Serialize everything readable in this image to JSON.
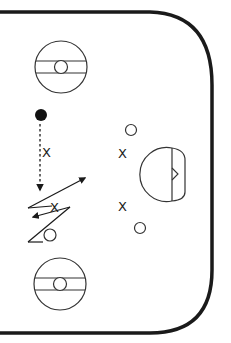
{
  "diagram": {
    "colors": {
      "line": "#1a1a1a",
      "background": "#ffffff"
    },
    "players": [
      {
        "type": "X",
        "label": "X",
        "x": 47,
        "y": 152
      },
      {
        "type": "X",
        "label": "X",
        "x": 55,
        "y": 211
      },
      {
        "type": "X",
        "label": "X",
        "x": 123,
        "y": 157
      },
      {
        "type": "X",
        "label": "X",
        "x": 123,
        "y": 210
      }
    ],
    "markers": [
      {
        "type": "O",
        "x": 50,
        "y": 235
      },
      {
        "type": "O",
        "x": 131,
        "y": 130
      },
      {
        "type": "O",
        "x": 140,
        "y": 228
      }
    ],
    "puck": {
      "x": 41,
      "y": 115
    },
    "elements": [
      "rink-boards",
      "faceoff-circle-top",
      "faceoff-circle-bottom",
      "goal-crease",
      "pass-arrow",
      "skating-path"
    ]
  }
}
